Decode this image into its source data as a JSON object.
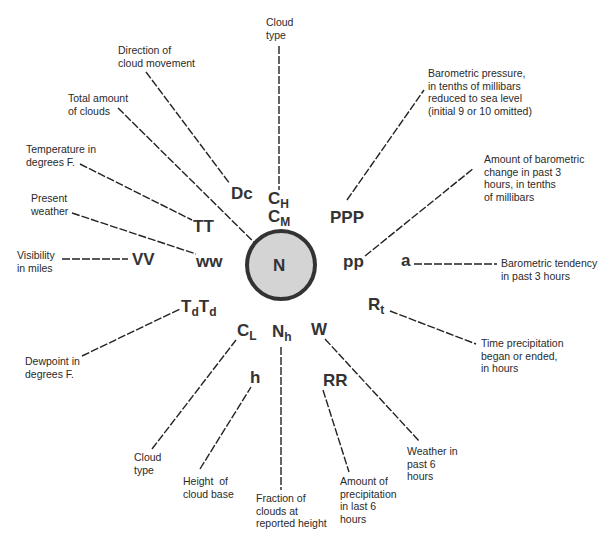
{
  "diagram": {
    "center_symbol": "N",
    "symbols": {
      "dc": "Dc",
      "ch_base": "C",
      "ch_sub": "H",
      "cm_base": "C",
      "cm_sub": "M",
      "ppp": "PPP",
      "pp": "pp",
      "a": "a",
      "rt_base": "R",
      "rt_sub": "t",
      "w": "W",
      "rr": "RR",
      "nh_base": "N",
      "nh_sub": "h",
      "h": "h",
      "cl_base": "C",
      "cl_sub": "L",
      "td1_base": "T",
      "td1_sub": "d",
      "td2_base": "T",
      "td2_sub": "d",
      "vv": "VV",
      "ww": "ww",
      "tt": "TT"
    },
    "labels": {
      "cloud_type_top": "Cloud\ntype",
      "direction_cloud": "Direction of\ncloud movement",
      "total_clouds": "Total amount\nof clouds",
      "temperature": "Temperature in\ndegrees F.",
      "present_weather": "Present\nweather",
      "visibility": "Visibility\nin miles",
      "dewpoint": "Dewpoint in\ndegrees F.",
      "cloud_type_low": "Cloud\ntype",
      "cloud_base": "Height  of\ncloud base",
      "fraction_clouds": "Fraction of\nclouds at\nreported height",
      "precip_amount": "Amount of\nprecipitation\nin last 6\nhours",
      "weather_past": "Weather in\npast 6\nhours",
      "time_precip": "Time precipitation\nbegan or ended,\nin hours",
      "baro_tendency": "Barometric tendency\nin past 3 hours",
      "baro_change": "Amount of barometric\nchange in past 3\nhours, in tenths\nof millibars",
      "baro_pressure": "Barometric pressure,\nin tenths of millibars\nreduced to sea level\n(initial 9 or 10 omitted)"
    },
    "colors": {
      "circle_fill": "#d4d4d4",
      "circle_stroke": "#333333",
      "line": "#222222"
    }
  }
}
